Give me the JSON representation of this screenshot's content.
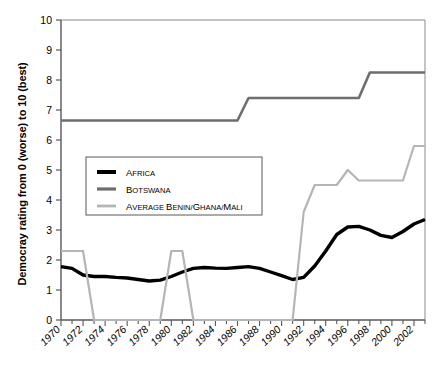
{
  "axes": {
    "ylabel": "Democray rating from 0 (worse) to 10 (best)",
    "ytick_labels": [
      "10",
      "9",
      "8",
      "7",
      "6",
      "5",
      "4",
      "3",
      "2",
      "1",
      "0"
    ],
    "xtick_labels": [
      "1970",
      "1972",
      "1974",
      "1976",
      "1978",
      "1980",
      "1982",
      "1984",
      "1986",
      "1988",
      "1990",
      "1992",
      "1994",
      "1996",
      "1998",
      "2000",
      "2002"
    ]
  },
  "legend": {
    "items": [
      {
        "label": "Africa",
        "label_head": "A",
        "label_rest": "FRICA",
        "color": "#000000",
        "width": 3.4
      },
      {
        "label": "Botswana",
        "label_head": "B",
        "label_rest": "OTSWANA",
        "color": "#6d6e70",
        "width": 2.6
      },
      {
        "label": "Average Benin/Ghana/Mali",
        "label_head": "A",
        "label_rest": "VERAGE ",
        "label_head2": "B",
        "label_rest2": "ENIN/",
        "label_head3": "G",
        "label_rest3": "HANA/",
        "label_head4": "M",
        "label_rest4": "ALI",
        "color": "#b4b5b7",
        "width": 2.2
      }
    ]
  },
  "colors": {
    "africa": "#000000",
    "botswana": "#6d6e70",
    "average": "#b4b5b7",
    "axis": "#58585a",
    "frame": "#8a8b8d"
  },
  "chart_data": {
    "type": "line",
    "title": "",
    "xlabel": "",
    "ylabel": "Democray rating from 0 (worse) to 10 (best)",
    "xlim": [
      1970,
      2003
    ],
    "ylim": [
      0,
      10
    ],
    "grid": false,
    "legend_position": "center-left",
    "x": [
      1970,
      1971,
      1972,
      1973,
      1974,
      1975,
      1976,
      1977,
      1978,
      1979,
      1980,
      1981,
      1982,
      1983,
      1984,
      1985,
      1986,
      1987,
      1988,
      1989,
      1990,
      1991,
      1992,
      1993,
      1994,
      1995,
      1996,
      1997,
      1998,
      1999,
      2000,
      2001,
      2002,
      2003
    ],
    "series": [
      {
        "name": "Africa",
        "color": "#000000",
        "width": 3.4,
        "values": [
          1.78,
          1.72,
          1.5,
          1.45,
          1.45,
          1.42,
          1.4,
          1.35,
          1.3,
          1.33,
          1.45,
          1.6,
          1.72,
          1.75,
          1.73,
          1.72,
          1.75,
          1.78,
          1.72,
          1.6,
          1.48,
          1.35,
          1.42,
          1.8,
          2.3,
          2.85,
          3.1,
          3.12,
          3.0,
          2.82,
          2.75,
          2.95,
          3.2,
          3.35
        ]
      },
      {
        "name": "Botswana",
        "color": "#6d6e70",
        "width": 2.6,
        "values": [
          6.65,
          6.65,
          6.65,
          6.65,
          6.65,
          6.65,
          6.65,
          6.65,
          6.65,
          6.65,
          6.65,
          6.65,
          6.65,
          6.65,
          6.65,
          6.65,
          6.65,
          7.4,
          7.4,
          7.4,
          7.4,
          7.4,
          7.4,
          7.4,
          7.4,
          7.4,
          7.4,
          7.4,
          8.25,
          8.25,
          8.25,
          8.25,
          8.25,
          8.25
        ]
      },
      {
        "name": "Average Benin/Ghana/Mali",
        "color": "#b4b5b7",
        "width": 2.2,
        "values": [
          2.3,
          2.3,
          2.3,
          0.0,
          0.0,
          0.0,
          0.0,
          0.0,
          0.0,
          0.0,
          2.3,
          2.3,
          0.0,
          0.0,
          0.0,
          0.0,
          0.0,
          0.0,
          0.0,
          0.0,
          0.0,
          0.0,
          3.6,
          4.5,
          4.5,
          4.5,
          5.0,
          4.65,
          4.65,
          4.65,
          4.65,
          4.65,
          5.8,
          5.8
        ]
      }
    ]
  }
}
